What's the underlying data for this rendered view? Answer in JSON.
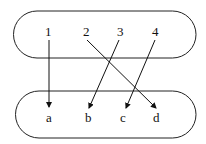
{
  "diagram": {
    "type": "function-mapping",
    "domain_set": {
      "elements": [
        "1",
        "2",
        "3",
        "4"
      ]
    },
    "codomain_set": {
      "elements": [
        "a",
        "b",
        "c",
        "d"
      ]
    },
    "mappings": [
      {
        "from": "1",
        "to": "a"
      },
      {
        "from": "2",
        "to": "d"
      },
      {
        "from": "3",
        "to": "b"
      },
      {
        "from": "4",
        "to": "c"
      }
    ]
  }
}
